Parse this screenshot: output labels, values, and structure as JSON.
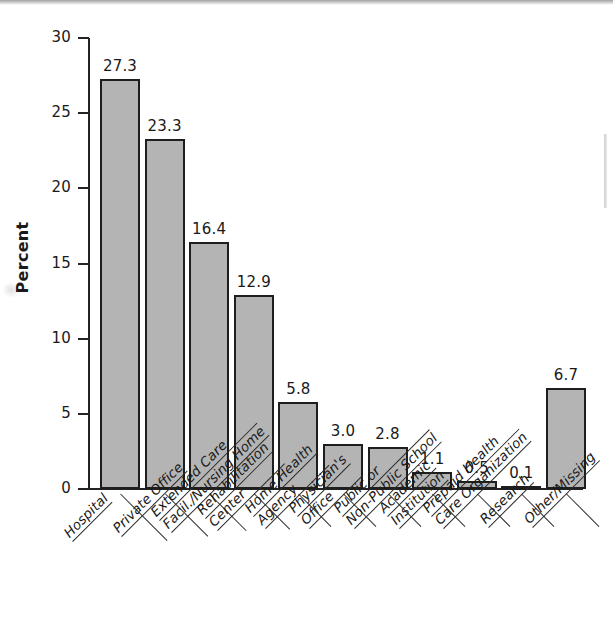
{
  "chart_data": {
    "type": "bar",
    "title": "",
    "subtitle": "",
    "xlabel": "",
    "ylabel": "Percent",
    "ylim": [
      0,
      30
    ],
    "ytick_values": [
      0,
      5,
      10,
      15,
      20,
      25,
      30
    ],
    "ytick_labels": [
      "0",
      "5",
      "10",
      "15",
      "20",
      "25",
      "30"
    ],
    "grid": false,
    "legend": null,
    "bar_fill_color": "#b4b4b4",
    "bar_edge_color": "#1e1e1e",
    "categories": [
      "Hospital",
      "Private Office",
      "Extended Care Facil./Nursing Home",
      "Rehabilitation Center",
      "Home Health Agency",
      "Physician's Office",
      "Public or Non-Public School",
      "Academic Institution",
      "Prepaid Health Care Organization",
      "Research",
      "Other/Missing"
    ],
    "category_lines": [
      [
        "Hospital"
      ],
      [
        "Private Office"
      ],
      [
        "Extended Care",
        "Facil./Nursing Home"
      ],
      [
        "Rehabilitation",
        "Center"
      ],
      [
        "Home Health",
        "Agency"
      ],
      [
        "Physician's",
        "Office"
      ],
      [
        "Public or",
        "Non-Public School"
      ],
      [
        "Academic",
        "Institution"
      ],
      [
        "Prepaid Health",
        "Care Organization"
      ],
      [
        "Research"
      ],
      [
        "Other/Missing"
      ]
    ],
    "values": [
      27.3,
      23.3,
      16.4,
      12.9,
      5.8,
      3.0,
      2.8,
      1.1,
      0.5,
      0.1,
      6.7
    ],
    "value_labels": [
      "27.3",
      "23.3",
      "16.4",
      "12.9",
      "5.8",
      "3.0",
      "2.8",
      "1.1",
      "0.5",
      "0.1",
      "6.7"
    ]
  }
}
